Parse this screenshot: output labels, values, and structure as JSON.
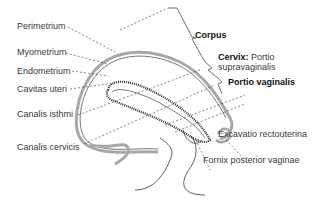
{
  "labels": {
    "left": {
      "perimetrium": "Perimetrium",
      "myometrium": "Myometrium",
      "endometrium": "Endometrium",
      "cavitas_uteri": "Cavitas uteri",
      "canalis_isthmi": "Canalis isthmi",
      "canalis_cervicis": "Canalis cervicis"
    },
    "right": {
      "corpus": "Corpus",
      "cervix_bold": "Cervix:",
      "cervix_rest": " Portio",
      "supravaginalis": "supravaginalis",
      "portio_vaginalis": "Portio vaginalis",
      "excavatio": "Excavatio rectouterina",
      "fornix": "Fornix posterior vaginae"
    }
  },
  "colors": {
    "text": "#3a3a3a",
    "bold_text": "#111111",
    "line": "#333333",
    "perimetrium_gray": "#a8a8a8"
  }
}
